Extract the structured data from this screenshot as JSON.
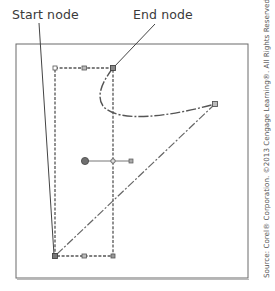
{
  "labels": {
    "start_node": "Start node",
    "end_node": "End node"
  },
  "credit": "Source: Corel® Corporation. ©2013 Cengage Learning®. All Rights Reserved.",
  "diagram": {
    "frame": {
      "x": 16,
      "y": 44,
      "width": 232,
      "height": 234
    },
    "selection_box": {
      "x": 55,
      "y": 68,
      "width": 58,
      "height": 188
    },
    "nodes": {
      "start": {
        "x": 55,
        "y": 256
      },
      "end": {
        "x": 113,
        "y": 68
      },
      "right": {
        "x": 215,
        "y": 104
      }
    },
    "rotation_center": {
      "x": 85,
      "y": 161
    },
    "colors": {
      "line": "#5a5a5a",
      "frame": "#6a6a6a",
      "handle_fill": "#8a8a8a",
      "text": "#3a3a3a"
    }
  }
}
